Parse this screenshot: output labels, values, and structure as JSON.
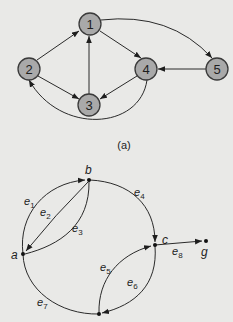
{
  "colors": {
    "background": "#e9e9e7",
    "node_fill": "#a9a9a9",
    "node_stroke": "#3a3a3a",
    "edge": "#2a2a2a"
  },
  "figure_a": {
    "caption": "(a)",
    "nodes": [
      {
        "id": "1",
        "label": "1"
      },
      {
        "id": "2",
        "label": "2"
      },
      {
        "id": "3",
        "label": "3"
      },
      {
        "id": "4",
        "label": "4"
      },
      {
        "id": "5",
        "label": "5"
      }
    ],
    "edges": [
      {
        "from": "2",
        "to": "1"
      },
      {
        "from": "1",
        "to": "4"
      },
      {
        "from": "1",
        "to": "5"
      },
      {
        "from": "5",
        "to": "4"
      },
      {
        "from": "3",
        "to": "1"
      },
      {
        "from": "2",
        "to": "3"
      },
      {
        "from": "4",
        "to": "3"
      },
      {
        "from": "4",
        "to": "2"
      }
    ]
  },
  "figure_b": {
    "vertices": [
      {
        "id": "a",
        "label": "a"
      },
      {
        "id": "b",
        "label": "b"
      },
      {
        "id": "c",
        "label": "c"
      },
      {
        "id": "g",
        "label": "g"
      },
      {
        "id": "d",
        "label": ""
      }
    ],
    "edges": [
      {
        "name": "e",
        "sub": "1",
        "from": "a",
        "to": "b"
      },
      {
        "name": "e",
        "sub": "2",
        "from": "b",
        "to": "a"
      },
      {
        "name": "e",
        "sub": "3",
        "from": "b",
        "to": "a"
      },
      {
        "name": "e",
        "sub": "4",
        "from": "b",
        "to": "c"
      },
      {
        "name": "e",
        "sub": "5",
        "from": "d",
        "to": "c"
      },
      {
        "name": "e",
        "sub": "6",
        "from": "c",
        "to": "d"
      },
      {
        "name": "e",
        "sub": "7",
        "from": "a",
        "to": "d"
      },
      {
        "name": "e",
        "sub": "8",
        "from": "c",
        "to": "g"
      }
    ]
  }
}
